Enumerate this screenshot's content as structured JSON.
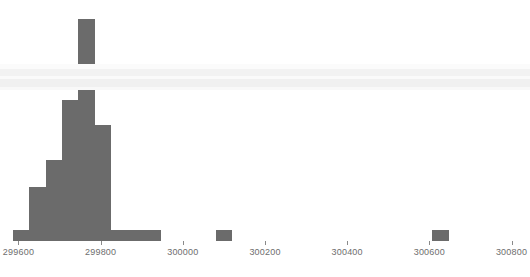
{
  "chart_data": {
    "type": "bar",
    "title": "",
    "subtitle": "",
    "xlabel": "",
    "ylabel": "",
    "grid": false,
    "legend": false,
    "bar_color": "#6b6b6b",
    "background_color": "#ffffff",
    "xlim": [
      299555,
      300845
    ],
    "ylim": [
      0,
      89
    ],
    "x_ticks": [
      {
        "value": 299600,
        "label": "299600"
      },
      {
        "value": 299800,
        "label": "299800"
      },
      {
        "value": 300000,
        "label": "300000"
      },
      {
        "value": 300200,
        "label": "300200"
      },
      {
        "value": 300400,
        "label": "300400"
      },
      {
        "value": 300600,
        "label": "300600"
      },
      {
        "value": 300800,
        "label": "300800"
      }
    ],
    "y_ticks": [],
    "bin_width": 40,
    "bins": [
      {
        "x_left": 299586,
        "x_right": 299626,
        "count": 4
      },
      {
        "x_left": 299626,
        "x_right": 299666,
        "count": 20
      },
      {
        "x_left": 299666,
        "x_right": 299706,
        "count": 30
      },
      {
        "x_left": 299706,
        "x_right": 299746,
        "count": 52
      },
      {
        "x_left": 299746,
        "x_right": 299786,
        "count": 82
      },
      {
        "x_left": 299786,
        "x_right": 299826,
        "count": 43
      },
      {
        "x_left": 299826,
        "x_right": 299866,
        "count": 4
      },
      {
        "x_left": 299866,
        "x_right": 299906,
        "count": 4
      },
      {
        "x_left": 299906,
        "x_right": 299946,
        "count": 4
      },
      {
        "x_left": 300080,
        "x_right": 300120,
        "count": 4
      },
      {
        "x_left": 300607,
        "x_right": 300647,
        "count": 4
      }
    ],
    "annotations": []
  }
}
